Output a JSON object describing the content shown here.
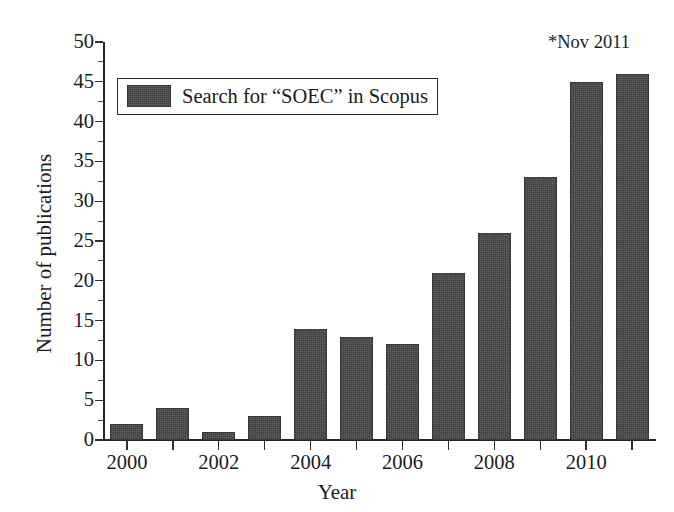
{
  "chart_data": {
    "type": "bar",
    "title": "",
    "subtitle": "",
    "xlabel": "Year",
    "ylabel": "Number of publications",
    "categories": [
      "2000",
      "2001",
      "2002",
      "2003",
      "2004",
      "2005",
      "2006",
      "2007",
      "2008",
      "2009",
      "2010",
      "2011"
    ],
    "values": [
      2,
      4,
      1,
      3,
      14,
      13,
      12,
      21,
      26,
      33,
      45,
      46
    ],
    "series": [
      {
        "name": "Search for “SOEC” in Scopus",
        "values": [
          2,
          4,
          1,
          3,
          14,
          13,
          12,
          21,
          26,
          33,
          45,
          46
        ]
      }
    ],
    "ylim": [
      0,
      50
    ],
    "ytick_values": [
      0,
      5,
      10,
      15,
      20,
      25,
      30,
      35,
      40,
      45,
      50
    ],
    "ytick_labels": [
      "0",
      "5",
      "10",
      "15",
      "20",
      "25",
      "30",
      "35",
      "40",
      "45",
      "50"
    ],
    "y_minor_tick_values": [
      2.5,
      7.5,
      12.5,
      17.5,
      22.5,
      27.5,
      32.5,
      37.5,
      42.5,
      47.5
    ],
    "xtick_labels_shown": [
      "2000",
      "2002",
      "2004",
      "2006",
      "2008",
      "2010"
    ],
    "grid": false,
    "legend_position": "upper left",
    "bar_color": "#474747",
    "axis_color": "#262626",
    "background_color": "#ffffff"
  },
  "legend": {
    "entry_label": "Search for “SOEC” in Scopus"
  },
  "annotations": {
    "note": "*Nov 2011"
  },
  "axes": {
    "x_title": "Year",
    "y_title": "Number of publications"
  }
}
